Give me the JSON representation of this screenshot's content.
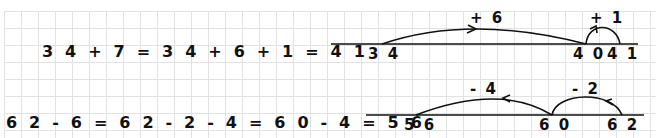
{
  "equations": {
    "addition": "3 4 + 7 = 3 4 + 6 + 1 = 4 1",
    "subtraction": "6 2 - 6 = 6 2 - 2 - 4 = 6 0 - 4 = 5 6"
  },
  "number_lines": {
    "addition": {
      "ticks": [
        "3 4",
        "4 0",
        "4 1"
      ],
      "jumps": [
        {
          "label": "+ 6",
          "from": "34",
          "to": "40"
        },
        {
          "label": "+ 1",
          "from": "40",
          "to": "41"
        }
      ]
    },
    "subtraction": {
      "ticks": [
        "5 6",
        "6 0",
        "6 2"
      ],
      "jumps": [
        {
          "label": "- 2",
          "from": "62",
          "to": "60"
        },
        {
          "label": "- 4",
          "from": "60",
          "to": "56"
        }
      ]
    }
  },
  "colors": {
    "ink": "#111111",
    "grid": "#e2e2e2"
  }
}
